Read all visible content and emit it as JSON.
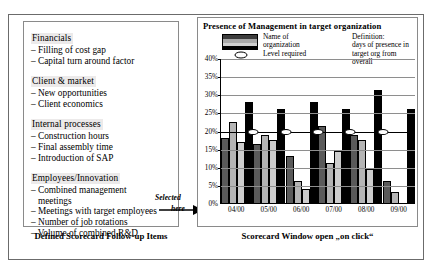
{
  "left_panel": {
    "groups": [
      {
        "head": "Financials",
        "items": [
          "Filling of cost gap",
          "Capital turn around factor"
        ]
      },
      {
        "head": "Client & market",
        "items": [
          "New opportunities",
          "Client economics"
        ]
      },
      {
        "head": "Internal processes",
        "items": [
          "Construction hours",
          "Final assembly time",
          "Introduction of SAP"
        ]
      },
      {
        "head": "Employees/Innovation",
        "items": [
          "Combined management\nmeetings",
          "Meetings with target employees",
          "Number of job rotations",
          "Volume of combined R&D"
        ]
      }
    ],
    "caption": "Defined Scorecard Follow-up Items",
    "bullet": "–"
  },
  "annotation": {
    "line1": "Selected",
    "line2": "here"
  },
  "right_panel": {
    "title": "Presence of  Management in target organization",
    "caption": "Scorecard Window open „on click“",
    "legend": {
      "series_label_line1": "Name of",
      "series_label_line2": "organization",
      "level_label": "Level required",
      "definition_line1": "Definition:",
      "definition_line2": "days of presence in",
      "definition_line3": "target  org from overall"
    }
  },
  "chart_data": {
    "type": "bar",
    "title": "Presence of  Management in target organization",
    "xlabel": "",
    "ylabel": "",
    "ylim": [
      0,
      40
    ],
    "ytick_labels": [
      "0%",
      "5%",
      "10%",
      "15%",
      "20%",
      "25%",
      "30%",
      "35%",
      "40%"
    ],
    "ytick_values": [
      0,
      5,
      10,
      15,
      20,
      25,
      30,
      35,
      40
    ],
    "grid": true,
    "legend_position": "top",
    "categories": [
      "04/00",
      "05/00",
      "06/00",
      "07/00",
      "08/00",
      "09/00"
    ],
    "series": [
      {
        "name": "Org 1",
        "color": "#5a5a5a",
        "values": [
          18,
          16.5,
          13,
          21.5,
          19,
          6
        ]
      },
      {
        "name": "Org 2",
        "color": "#b4b4b4",
        "values": [
          22.5,
          19,
          6,
          11,
          17.5,
          3
        ]
      },
      {
        "name": "Org 3",
        "color": "#cdcdcd",
        "values": [
          17,
          17.5,
          4,
          14.5,
          9.5,
          null
        ]
      },
      {
        "name": "Org 4",
        "color": "#000000",
        "values": [
          28,
          26,
          28,
          26,
          31.5,
          26
        ]
      }
    ],
    "threshold": {
      "name": "Level required",
      "value": 20,
      "marker": "ellipse"
    }
  }
}
